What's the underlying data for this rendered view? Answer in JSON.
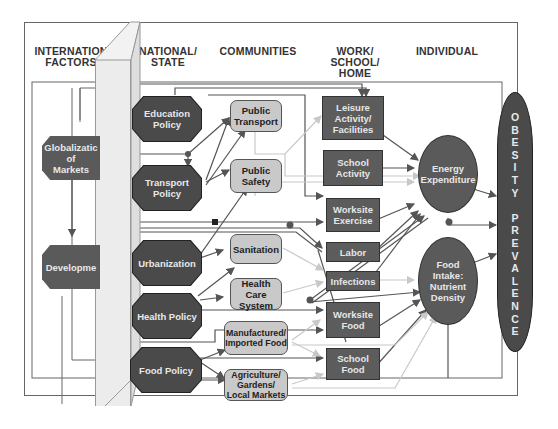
{
  "headers": {
    "international": "INTERNATIONAL/ FACTORS",
    "international_line1": "INTERNATION",
    "international_line2": "FACTORS",
    "national_line1": "NATIONAL/",
    "national_line2": "STATE",
    "communities": "COMMUNITIES",
    "work_line1": "WORK/",
    "work_line2": "SCHOOL/",
    "work_line3": "HOME",
    "individual": "INDIVIDUAL"
  },
  "international_nodes": [
    {
      "id": "globalization",
      "label": "Globalization of Markets",
      "display": "Globalizatic\nof\nMarkets"
    },
    {
      "id": "development",
      "label": "Development",
      "display": "Developme"
    }
  ],
  "national_nodes": [
    {
      "id": "education-policy",
      "label": "Education Policy"
    },
    {
      "id": "transport-policy",
      "label": "Transport Policy"
    },
    {
      "id": "urbanization",
      "label": "Urbanization"
    },
    {
      "id": "health-policy",
      "label": "Health Policy"
    },
    {
      "id": "food-policy",
      "label": "Food Policy"
    }
  ],
  "community_nodes": [
    {
      "id": "public-transport",
      "label": "Public Transport"
    },
    {
      "id": "public-safety",
      "label": "Public Safety"
    },
    {
      "id": "sanitation",
      "label": "Sanitation"
    },
    {
      "id": "health-care-system",
      "label": "Health Care System"
    },
    {
      "id": "manufactured-imported-food",
      "label": "Manufactured/ Imported Food"
    },
    {
      "id": "agriculture-gardens-local-markets",
      "label": "Agriculture/ Gardens/ Local Markets"
    }
  ],
  "work_nodes": [
    {
      "id": "leisure",
      "label": "Leisure Activity/ Facilities"
    },
    {
      "id": "school-activity",
      "label": "School Activity"
    },
    {
      "id": "worksite-exercise",
      "label": "Worksite Exercise"
    },
    {
      "id": "labor",
      "label": "Labor"
    },
    {
      "id": "infections",
      "label": "Infections"
    },
    {
      "id": "worksite-food",
      "label": "Worksite Food"
    },
    {
      "id": "school-food",
      "label": "School Food"
    }
  ],
  "individual_nodes": [
    {
      "id": "energy-expenditure",
      "label": "Energy Expenditure"
    },
    {
      "id": "food-intake",
      "label": "Food Intake: Nutrient Density"
    }
  ],
  "outcome": {
    "label": "OBESITY PREVALENCE",
    "letters": [
      "O",
      "B",
      "E",
      "S",
      "I",
      "T",
      "Y",
      " ",
      "P",
      "R",
      "E",
      "V",
      "A",
      "L",
      "E",
      "N",
      "C",
      "E"
    ]
  },
  "colors": {
    "dark_node": "#4a4a4a",
    "light_node": "#c9c9c9",
    "wire_dark": "#555555",
    "wire_light": "#c8c8c8",
    "frame": "#666666"
  }
}
